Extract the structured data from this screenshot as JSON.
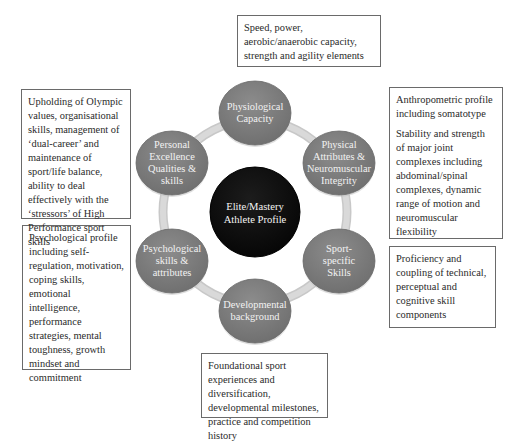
{
  "center": {
    "label_lines": [
      "Elite/Mastery",
      "Athlete Profile"
    ],
    "color": "#111111"
  },
  "node_color": "#7f7f7f",
  "ring_color": "#d9d9d9",
  "nodes": [
    {
      "id": "physiological",
      "label_lines": [
        "Physiological",
        "Capacity"
      ]
    },
    {
      "id": "physical",
      "label_lines": [
        "Physical",
        "Attributes &",
        "Neuromuscular",
        "Integrity"
      ]
    },
    {
      "id": "sport-specific",
      "label_lines": [
        "Sport-",
        "specific",
        "Skills"
      ]
    },
    {
      "id": "developmental",
      "label_lines": [
        "Developmental",
        "background"
      ]
    },
    {
      "id": "psychological",
      "label_lines": [
        "Psychological",
        "skills &",
        "attributes"
      ]
    },
    {
      "id": "personal",
      "label_lines": [
        "Personal",
        "Excellence",
        "Qualities &",
        "skills"
      ]
    }
  ],
  "boxes": {
    "physiological": [
      "Speed, power, aerobic/anaerobic capacity, strength and agility elements"
    ],
    "physical": [
      "Anthropometric profile including somatotype",
      "Stability and strength of major joint complexes including abdominal/spinal complexes, dynamic range of motion and neuromuscular flexibility"
    ],
    "sport_specific": [
      "Proficiency and coupling of technical, perceptual and cognitive skill components"
    ],
    "developmental": [
      "Foundational sport experiences and diversification, developmental milestones, practice and competition history"
    ],
    "psychological": [
      "Psychological profile including self-regulation, motivation, coping skills, emotional intelligence, performance strategies, mental toughness, growth mindset and commitment"
    ],
    "personal": [
      "Upholding of Olympic values, organisational skills, management of ‘dual-career’ and maintenance of sport/life balance, ability to deal effectively with the ‘stressors’ of High Performance sport skills"
    ]
  }
}
